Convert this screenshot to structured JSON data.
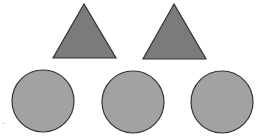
{
  "diagram": {
    "colors": {
      "triangle_fill": "#7b7b7b",
      "circle_fill": "#a2a2a2",
      "stroke": "#333333",
      "background": "#ffffff"
    },
    "triangles": [
      {
        "id": "triangle-1",
        "points": "84,4 53,58 116,58"
      },
      {
        "id": "triangle-2",
        "points": "174,4 143,59 206,59"
      }
    ],
    "circles": [
      {
        "id": "circle-1",
        "cx": 43,
        "cy": 101,
        "r": 31
      },
      {
        "id": "circle-2",
        "cx": 133,
        "cy": 102,
        "r": 31
      },
      {
        "id": "circle-3",
        "cx": 222,
        "cy": 102,
        "r": 31
      }
    ],
    "edge_mark": "."
  }
}
